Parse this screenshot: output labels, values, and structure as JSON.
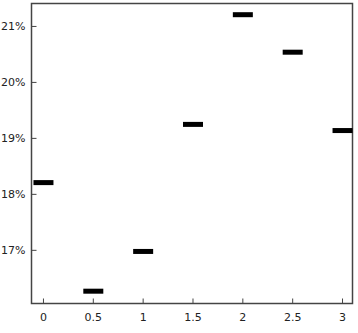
{
  "chart_data": {
    "type": "scatter",
    "marker": "horizontal-dash",
    "title": "",
    "xlabel": "",
    "ylabel": "",
    "x": [
      0,
      0.5,
      1,
      1.5,
      2,
      2.5,
      3
    ],
    "values": [
      18.21,
      16.27,
      16.98,
      19.25,
      21.21,
      20.54,
      19.14
    ],
    "value_unit": "%",
    "xlim": [
      -0.12,
      3.1
    ],
    "ylim": [
      16.05,
      21.41
    ],
    "x_ticks": [
      0,
      0.5,
      1,
      1.5,
      2,
      2.5,
      3
    ],
    "x_tick_labels": [
      "0",
      "0.5",
      "1",
      "1.5",
      "2",
      "2.5",
      "3"
    ],
    "y_ticks": [
      17,
      18,
      19,
      20,
      21
    ],
    "y_tick_labels": [
      "17%",
      "18%",
      "19%",
      "20%",
      "21%"
    ],
    "grid": false,
    "legend": null,
    "colors": {
      "marker": "#000000",
      "axes": "#444444",
      "text": "#222222",
      "background": "#ffffff"
    }
  }
}
